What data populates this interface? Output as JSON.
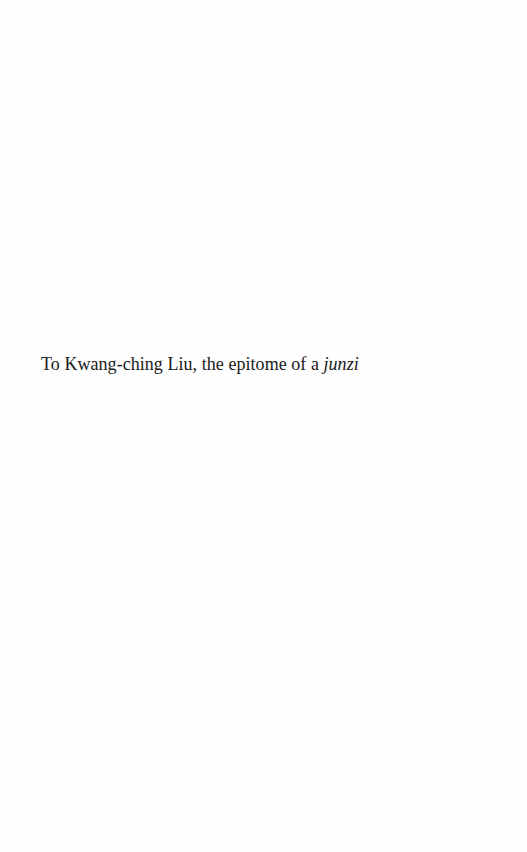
{
  "page": {
    "dedication": {
      "text": "To Kwang-ching Liu, the epitome of a ",
      "italic_term": "junzi"
    }
  }
}
